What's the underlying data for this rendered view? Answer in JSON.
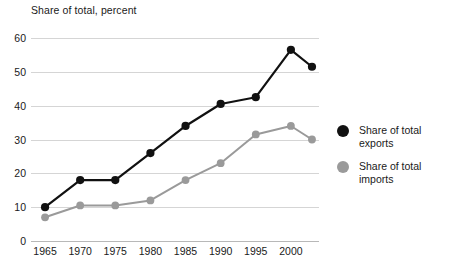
{
  "chart_data": {
    "type": "line",
    "title": "Share of total, percent",
    "xlabel": "",
    "ylabel": "Share of total, percent",
    "x": [
      1965,
      1970,
      1975,
      1980,
      1985,
      1990,
      1995,
      2000,
      2003
    ],
    "xtick_labels": [
      "1965",
      "1970",
      "1975",
      "1980",
      "1985",
      "1990",
      "1995",
      "2000"
    ],
    "xticks": [
      1965,
      1970,
      1975,
      1980,
      1985,
      1990,
      1995,
      2000
    ],
    "xlim": [
      1963,
      2004
    ],
    "ytick_labels": [
      "0",
      "10",
      "20",
      "30",
      "40",
      "50",
      "60"
    ],
    "yticks": [
      0,
      10,
      20,
      30,
      40,
      50,
      60
    ],
    "ylim": [
      0,
      60
    ],
    "grid": true,
    "legend_position": "right",
    "series": [
      {
        "name": "Share of total exports",
        "color": "#111111",
        "values": [
          10,
          18,
          18,
          26,
          34,
          40.5,
          42.5,
          56.5,
          51.5
        ]
      },
      {
        "name": "Share of total imports",
        "color": "#9a9a9a",
        "values": [
          7,
          10.5,
          10.5,
          12,
          18,
          23,
          31.5,
          34,
          30
        ]
      }
    ]
  },
  "legend": {
    "items": [
      {
        "label": "Share of total exports",
        "color": "#111111"
      },
      {
        "label": "Share of total imports",
        "color": "#9a9a9a"
      }
    ]
  },
  "colors": {
    "exports": "#111111",
    "imports": "#9a9a9a",
    "grid": "#d5d5d5",
    "axis": "#b8b8b8",
    "text": "#1a1a1a",
    "background": "#ffffff"
  }
}
